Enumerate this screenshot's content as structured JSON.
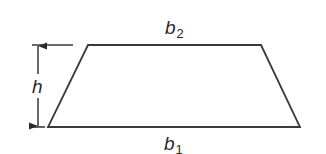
{
  "figure": {
    "shape": "trapezoid",
    "stroke_color": "#3a3a3a",
    "background": "#ffffff",
    "vertices": {
      "top_left": [
        88,
        45
      ],
      "top_right": [
        261,
        45
      ],
      "bottom_right": [
        300,
        127
      ],
      "bottom_left": [
        48,
        127
      ]
    }
  },
  "labels": {
    "top_base": {
      "symbol": "b",
      "subscript": "2"
    },
    "bottom_base": {
      "symbol": "b",
      "subscript": "1"
    },
    "height": {
      "symbol": "h"
    }
  },
  "dimension": {
    "type": "height",
    "arrow_x": 38,
    "from_y": 45,
    "to_y": 127
  }
}
